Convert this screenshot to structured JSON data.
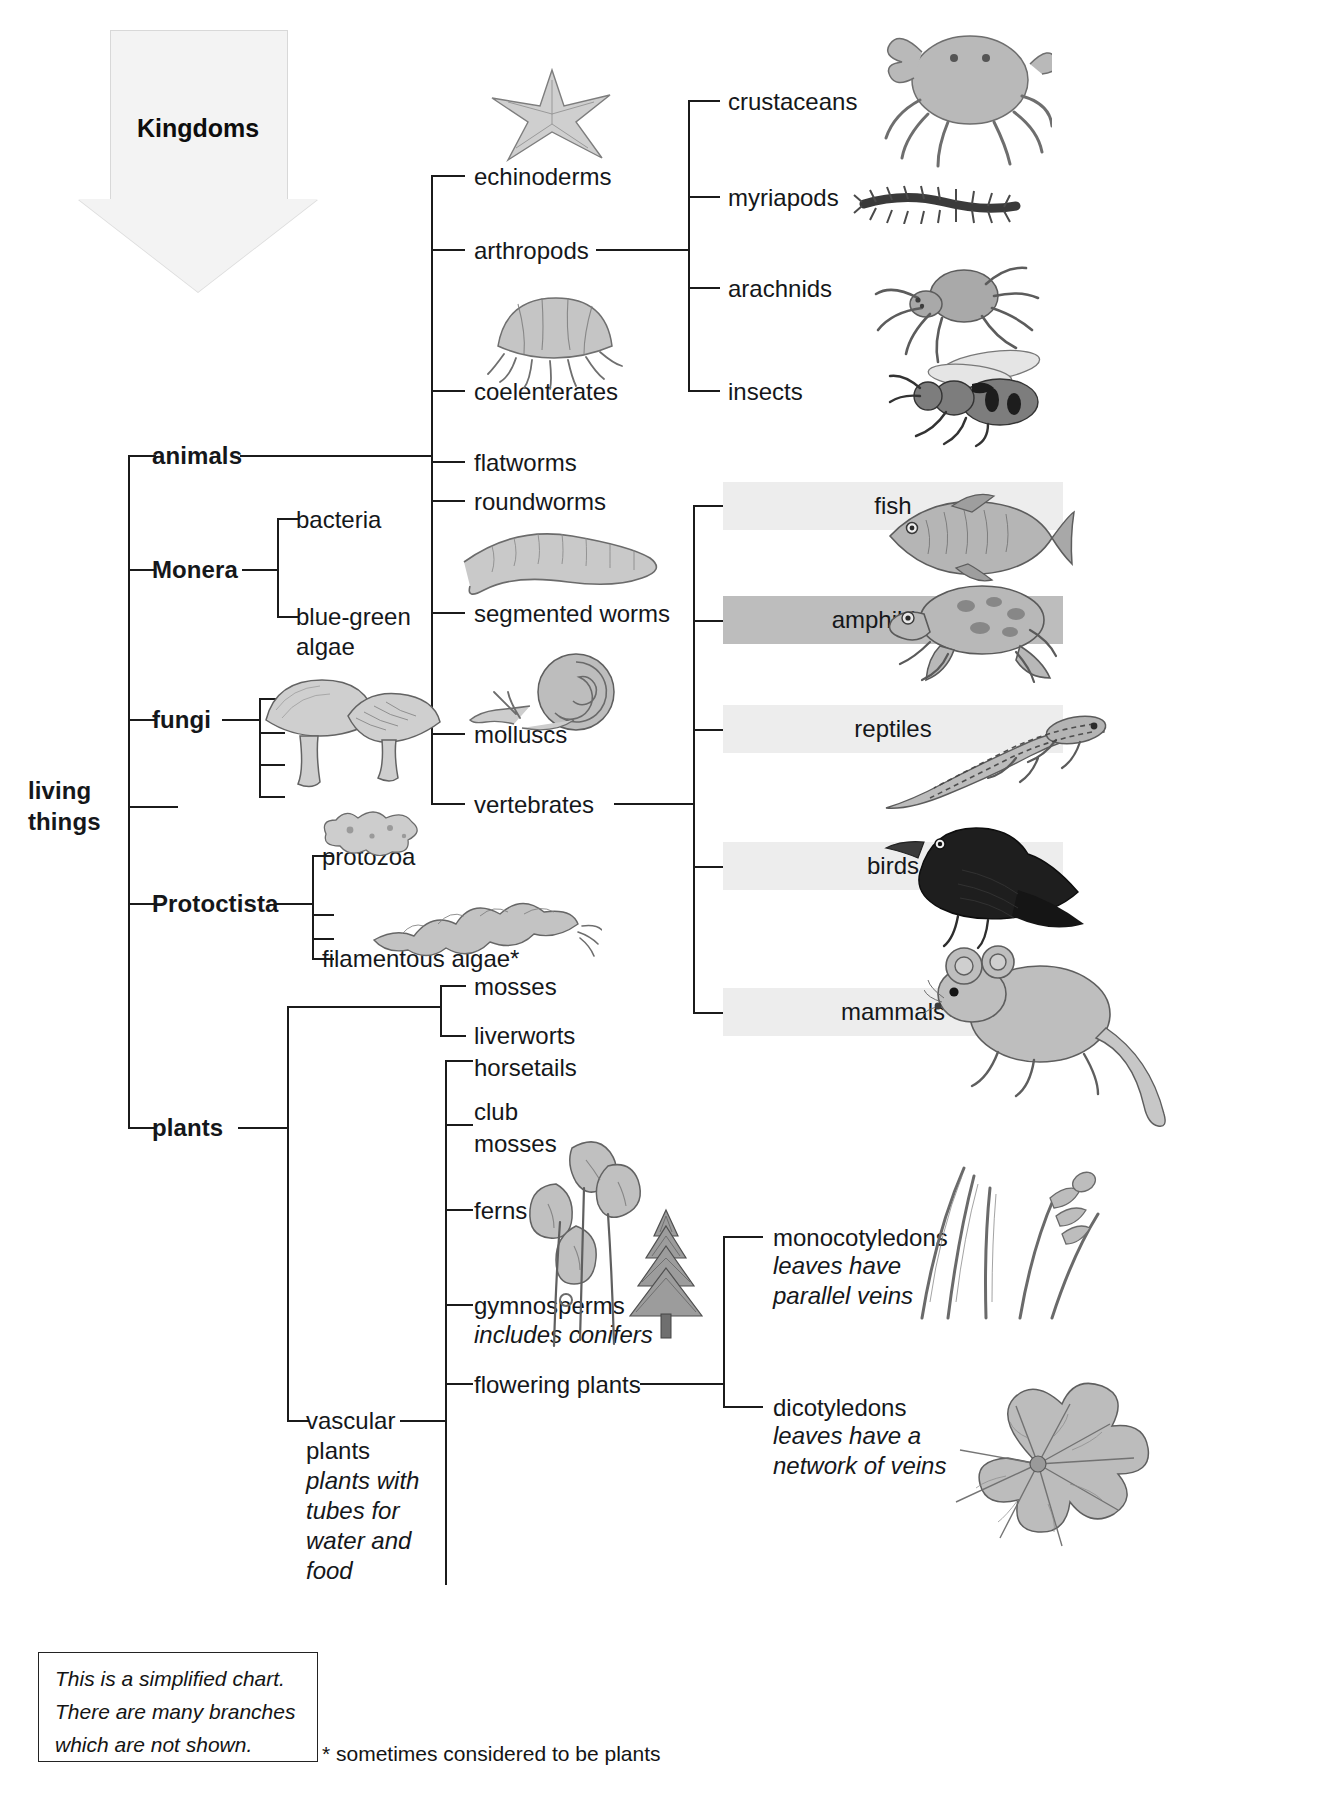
{
  "diagram": {
    "title_arrow": "Kingdoms",
    "root": "living things",
    "kingdoms": [
      "animals",
      "Monera",
      "fungi",
      "Protoctista",
      "plants"
    ],
    "monera_children": [
      "bacteria",
      "blue-green algae"
    ],
    "protoctista_children": [
      "protozoa",
      "filamentous algae*"
    ],
    "animal_phyla": [
      "echinoderms",
      "arthropods",
      "coelenterates",
      "flatworms",
      "roundworms",
      "segmented worms",
      "molluscs",
      "vertebrates"
    ],
    "arthropod_classes": [
      "crustaceans",
      "myriapods",
      "arachnids",
      "insects"
    ],
    "vertebrate_classes": [
      {
        "label": "fish",
        "shade": "light"
      },
      {
        "label": "amphibians",
        "shade": "dark"
      },
      {
        "label": "reptiles",
        "shade": "light"
      },
      {
        "label": "birds",
        "shade": "light"
      },
      {
        "label": "mammals",
        "shade": "light"
      }
    ],
    "plant_groups": {
      "non_vascular": [
        "mosses",
        "liverworts"
      ],
      "vascular_label": "vascular plants",
      "vascular_note": "plants with tubes for water and food",
      "vascular_children": [
        "horsetails",
        "club mosses",
        "ferns",
        "gymnosperms",
        "flowering plants"
      ],
      "gymnosperm_note": "includes conifers",
      "flowering_children": [
        {
          "label": "monocotyledons",
          "note": "leaves have parallel veins"
        },
        {
          "label": "dicotyledons",
          "note": "leaves have a network of veins"
        }
      ]
    },
    "note_box": [
      "This is a simplified chart.",
      "There are many branches",
      "which are not shown."
    ],
    "footnote": "* sometimes considered to be plants",
    "illustrations": [
      "starfish-illustration",
      "crab-illustration",
      "centipede-illustration",
      "spider-illustration",
      "wasp-illustration",
      "jellyfish-illustration",
      "earthworm-illustration",
      "snail-illustration",
      "fish-illustration",
      "frog-illustration",
      "lizard-illustration",
      "blackbird-illustration",
      "mouse-illustration",
      "mushroom-illustration",
      "amoeba-illustration",
      "algae-illustration",
      "fern-illustration",
      "conifer-illustration",
      "grass-illustration",
      "broadleaf-illustration"
    ],
    "colors": {
      "line": "#1b1b1b",
      "band_light": "#ededed",
      "band_dark": "#bdbdbd",
      "arrow_fill": "#f3f3f3"
    }
  }
}
